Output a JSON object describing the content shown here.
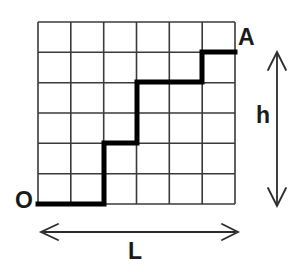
{
  "figure": {
    "grid": {
      "columns": 6,
      "rows": 6,
      "x0": 38,
      "y0": 22,
      "x1": 235,
      "y1": 204,
      "line_color": "#3a3a3a",
      "line_width": 1.6
    },
    "path": {
      "color": "#000000",
      "line_width": 5,
      "start_label": "O",
      "end_label": "A",
      "steps": [
        "R",
        "R",
        "U",
        "U",
        "R",
        "U",
        "U",
        "R",
        "R",
        "U",
        "R"
      ],
      "lattice_points": [
        [
          0,
          0
        ],
        [
          1,
          0
        ],
        [
          2,
          0
        ],
        [
          2,
          1
        ],
        [
          2,
          2
        ],
        [
          3,
          2
        ],
        [
          3,
          3
        ],
        [
          3,
          4
        ],
        [
          4,
          4
        ],
        [
          5,
          4
        ],
        [
          5,
          5
        ],
        [
          6,
          5
        ],
        [
          6,
          6
        ]
      ],
      "pixel_points": [
        [
          38,
          204
        ],
        [
          104,
          204
        ],
        [
          104,
          143
        ],
        [
          137,
          143
        ],
        [
          137,
          82
        ],
        [
          202,
          82
        ],
        [
          202,
          52
        ],
        [
          235,
          52
        ]
      ]
    },
    "labels": {
      "origin": "O",
      "endpoint": "A",
      "height": "h",
      "length": "L"
    },
    "dimensions": {
      "height_arrow": {
        "label": "h",
        "x": 277,
        "y_top": 53,
        "y_bottom": 205,
        "double_headed": true
      },
      "length_arrow": {
        "label": "L",
        "y": 232,
        "x_left": 42,
        "x_right": 237,
        "double_headed": true
      },
      "arrow_color": "#2b2b2b",
      "arrow_line_width": 1.8
    },
    "colors": {
      "background": "#ffffff",
      "grid": "#3a3a3a",
      "path": "#000000",
      "text": "#1a1a1a",
      "arrow": "#2b2b2b"
    }
  }
}
